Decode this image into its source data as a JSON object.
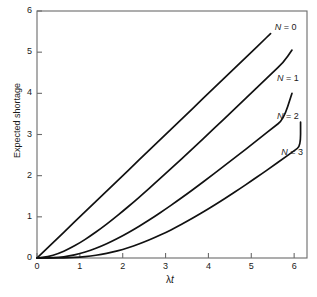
{
  "figure": {
    "background_color": "#ffffff",
    "line_color": "#111111",
    "axis_color": "#6b6b6b"
  },
  "chart_data": {
    "type": "line",
    "title": "",
    "subtitle": "",
    "xlabel": "λt",
    "xlabel_parts": {
      "lambda": "λ",
      "t": "t"
    },
    "ylabel": "Expected shortage",
    "xlim": [
      0,
      6.3
    ],
    "ylim": [
      0,
      6
    ],
    "xticks": [
      0,
      1,
      2,
      3,
      4,
      5,
      6
    ],
    "xticklabels": [
      "0",
      "1",
      "2",
      "3",
      "4",
      "5",
      "6"
    ],
    "yticks": [
      0,
      1,
      2,
      3,
      4,
      5,
      6
    ],
    "yticklabels": [
      "0",
      "1",
      "2",
      "3",
      "4",
      "5",
      "6"
    ],
    "grid": false,
    "legend": "inline-annotations",
    "tick_direction": "in",
    "spines": [
      "left",
      "bottom",
      "right",
      "top"
    ],
    "x": [
      0,
      0.25,
      0.5,
      0.75,
      1,
      1.25,
      1.5,
      1.75,
      2,
      2.25,
      2.5,
      2.75,
      3,
      3.25,
      3.5,
      3.75,
      4,
      4.25,
      4.5,
      4.75,
      5,
      5.25,
      5.5,
      5.75,
      6,
      6.15
    ],
    "series": [
      {
        "name": "N = 0",
        "label": "N = 0",
        "N": 0,
        "x_end": 5.45,
        "y_end": 5.45,
        "values": [
          0,
          0.25,
          0.5,
          0.75,
          1,
          1.25,
          1.5,
          1.75,
          2,
          2.25,
          2.5,
          2.75,
          3,
          3.25,
          3.5,
          3.75,
          4,
          4.25,
          4.5,
          4.75,
          5,
          5.25,
          5.45,
          null,
          null,
          null
        ],
        "label_pos": {
          "x": 5.55,
          "y": 5.58
        }
      },
      {
        "name": "N = 1",
        "label": "N = 1",
        "N": 1,
        "x_end": 5.95,
        "y_end": 5.05,
        "values": [
          0,
          0.027,
          0.107,
          0.222,
          0.368,
          0.537,
          0.723,
          0.922,
          1.135,
          1.355,
          1.582,
          1.814,
          2.05,
          2.289,
          2.53,
          2.774,
          3.018,
          3.264,
          3.511,
          3.759,
          4.007,
          4.256,
          4.504,
          4.753,
          5.002,
          null
        ],
        "label_pos": {
          "x": 5.6,
          "y": 4.35
        }
      },
      {
        "name": "N = 2",
        "label": "N = 2",
        "N": 2,
        "x_end": 5.95,
        "y_end": 4.0,
        "values": [
          0,
          0.002,
          0.014,
          0.047,
          0.104,
          0.187,
          0.288,
          0.407,
          0.541,
          0.688,
          0.846,
          1.013,
          1.189,
          1.37,
          1.557,
          1.749,
          1.944,
          2.142,
          2.343,
          2.545,
          2.748,
          2.953,
          3.159,
          3.365,
          3.571,
          null
        ],
        "label_pos": {
          "x": 5.6,
          "y": 3.42
        }
      },
      {
        "name": "N = 3",
        "label": "N = 3",
        "N": 3,
        "x_end": 6.15,
        "y_end": 3.3,
        "values": [
          0,
          0.0001,
          0.0014,
          0.0073,
          0.0213,
          0.0469,
          0.0857,
          0.1391,
          0.2073,
          0.29,
          0.3866,
          0.4962,
          0.6172,
          0.7487,
          0.8893,
          1.038,
          1.1938,
          1.3557,
          1.5229,
          1.6949,
          1.8708,
          2.0503,
          2.2328,
          2.4181,
          2.6056,
          2.718
        ],
        "label_pos": {
          "x": 5.7,
          "y": 2.55
        }
      }
    ]
  },
  "axes": {
    "x_title": "λt",
    "y_title": "Expected shortage"
  }
}
